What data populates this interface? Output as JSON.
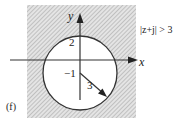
{
  "figure": {
    "panel_label": "(f)",
    "region_label": "|z+j| > 3",
    "axes": {
      "x_label": "x",
      "y_label": "y"
    },
    "circle": {
      "center_label": "−1",
      "top_label": "2",
      "radius_label": "3"
    },
    "colors": {
      "shade": "#cfcfcf",
      "line": "#333333",
      "background": "#ffffff"
    }
  }
}
